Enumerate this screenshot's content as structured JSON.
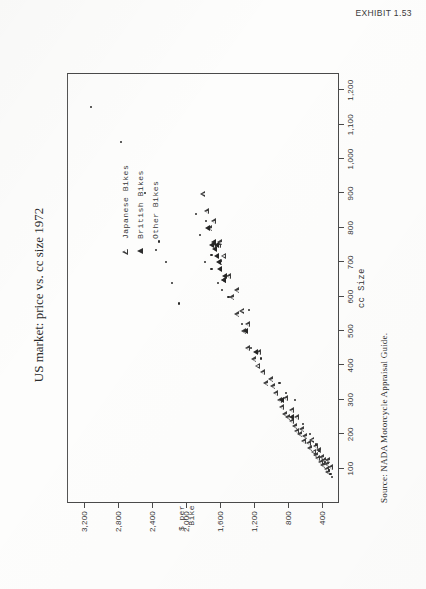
{
  "header": {
    "exhibit_label": "EXHIBIT 1.53"
  },
  "figure": {
    "title": "US market: price vs. cc size 1972",
    "source": "Source: NADA Motorcycle Appraisal Guide.",
    "rotation_deg": -90
  },
  "legend": {
    "position": "inside-right",
    "items": [
      {
        "label": "Japanese Bikes",
        "marker": "triangle-open-icon",
        "key": "jap"
      },
      {
        "label": "British Bikes",
        "marker": "triangle-filled-icon",
        "key": "brit"
      },
      {
        "label": "Other Bikes",
        "marker": "dot-icon",
        "key": "other"
      }
    ]
  },
  "chart_data": {
    "type": "scatter",
    "title": "US market: price vs. cc size 1972",
    "xlabel": "cc Size",
    "ylabel": "$ per Bike",
    "ylabel_lines": [
      "$ per",
      "Bike"
    ],
    "xlim": [
      0,
      1250
    ],
    "ylim": [
      200,
      3400
    ],
    "xticks": [
      100,
      200,
      300,
      400,
      500,
      600,
      700,
      800,
      900,
      1000,
      1100,
      1200
    ],
    "xticklabels": [
      "100",
      "200",
      "300",
      "400",
      "500",
      "600",
      "700",
      "800",
      "900",
      "1,000",
      "1,100",
      "1,200"
    ],
    "yticks": [
      400,
      800,
      1200,
      1600,
      2000,
      2400,
      2800,
      3200
    ],
    "yticklabels": [
      "400",
      "800",
      "1,200",
      "1,600",
      "2,000",
      "2,400",
      "2,800",
      "3,200"
    ],
    "grid": false,
    "legend_position": "inside-right",
    "series": [
      {
        "name": "Japanese Bikes",
        "marker": "triangle-open",
        "color": "#3d3d3d",
        "points": [
          [
            90,
            330
          ],
          [
            100,
            350
          ],
          [
            105,
            300
          ],
          [
            110,
            390
          ],
          [
            115,
            345
          ],
          [
            120,
            420
          ],
          [
            125,
            380
          ],
          [
            130,
            455
          ],
          [
            125,
            330
          ],
          [
            135,
            400
          ],
          [
            140,
            470
          ],
          [
            150,
            500
          ],
          [
            155,
            440
          ],
          [
            160,
            540
          ],
          [
            165,
            480
          ],
          [
            175,
            560
          ],
          [
            180,
            620
          ],
          [
            185,
            520
          ],
          [
            195,
            600
          ],
          [
            200,
            660
          ],
          [
            210,
            700
          ],
          [
            215,
            640
          ],
          [
            225,
            720
          ],
          [
            240,
            760
          ],
          [
            250,
            800
          ],
          [
            250,
            700
          ],
          [
            260,
            840
          ],
          [
            270,
            760
          ],
          [
            280,
            880
          ],
          [
            300,
            900
          ],
          [
            305,
            830
          ],
          [
            320,
            950
          ],
          [
            340,
            980
          ],
          [
            350,
            1060
          ],
          [
            360,
            1000
          ],
          [
            380,
            1100
          ],
          [
            400,
            1160
          ],
          [
            420,
            1200
          ],
          [
            440,
            1150
          ],
          [
            450,
            1280
          ],
          [
            500,
            1320
          ],
          [
            520,
            1280
          ],
          [
            550,
            1400
          ],
          [
            560,
            1340
          ],
          [
            600,
            1460
          ],
          [
            620,
            1400
          ],
          [
            650,
            1560
          ],
          [
            660,
            1500
          ],
          [
            700,
            1600
          ],
          [
            720,
            1560
          ],
          [
            750,
            1680
          ],
          [
            750,
            1620
          ],
          [
            760,
            1600
          ],
          [
            800,
            1720
          ],
          [
            820,
            1680
          ],
          [
            850,
            1760
          ],
          [
            900,
            1800
          ]
        ]
      },
      {
        "name": "British Bikes",
        "marker": "triangle-filled",
        "color": "#262626",
        "points": [
          [
            250,
            760
          ],
          [
            300,
            880
          ],
          [
            440,
            1180
          ],
          [
            500,
            1300
          ],
          [
            650,
            1560
          ],
          [
            660,
            1540
          ],
          [
            680,
            1600
          ],
          [
            700,
            1620
          ],
          [
            720,
            1640
          ],
          [
            740,
            1660
          ],
          [
            750,
            1640
          ],
          [
            750,
            1700
          ],
          [
            760,
            1680
          ],
          [
            800,
            1740
          ]
        ]
      },
      {
        "name": "Other Bikes",
        "marker": "dot",
        "color": "#2a2a2a",
        "points": [
          [
            75,
            280
          ],
          [
            85,
            300
          ],
          [
            95,
            320
          ],
          [
            120,
            360
          ],
          [
            150,
            430
          ],
          [
            170,
            470
          ],
          [
            200,
            540
          ],
          [
            230,
            620
          ],
          [
            300,
            720
          ],
          [
            320,
            820
          ],
          [
            350,
            900
          ],
          [
            420,
            1120
          ],
          [
            450,
            1240
          ],
          [
            520,
            1340
          ],
          [
            560,
            1260
          ],
          [
            600,
            1500
          ],
          [
            620,
            1580
          ],
          [
            640,
            1620
          ],
          [
            680,
            1700
          ],
          [
            700,
            1780
          ],
          [
            720,
            1700
          ],
          [
            780,
            1840
          ],
          [
            820,
            1760
          ],
          [
            840,
            1880
          ],
          [
            580,
            2080
          ],
          [
            640,
            2160
          ],
          [
            700,
            2240
          ],
          [
            760,
            2320
          ],
          [
            900,
            2480
          ],
          [
            1050,
            2760
          ],
          [
            1150,
            3120
          ]
        ]
      }
    ]
  }
}
